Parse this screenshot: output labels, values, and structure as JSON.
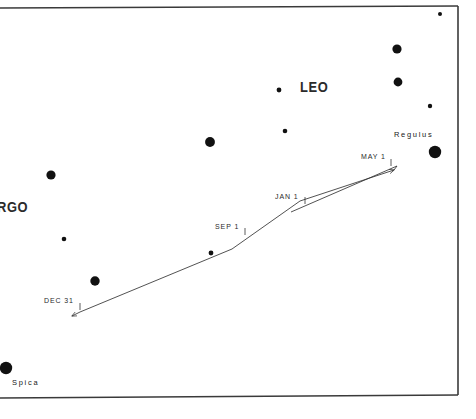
{
  "figure": {
    "kind": "star-chart",
    "background_color": "#ffffff",
    "ink_color": "#111111",
    "frame": {
      "stroke": "#3a3a3a",
      "top_left_x": 0,
      "top_left_y": 8,
      "top_right_x": 458,
      "top_right_y": 6,
      "bottom_right_x": 458,
      "bottom_right_y": 395,
      "bottom_left_x": 0,
      "bottom_left_y": 398
    }
  },
  "constellations": [
    {
      "id": "leo",
      "label": "LEO",
      "x": 300,
      "y": 86
    },
    {
      "id": "virgo",
      "label": "RGO",
      "x": 0,
      "y": 206,
      "note": "clipped-left-edge-of-VIRGO"
    }
  ],
  "named_stars": [
    {
      "id": "regulus",
      "label": "Regulus",
      "label_x": 394,
      "label_y": 134,
      "star_x": 435,
      "star_y": 152,
      "radius": 6.2
    },
    {
      "id": "spica",
      "label": "Spica",
      "label_x": 12,
      "label_y": 382,
      "star_x": 6,
      "star_y": 368,
      "radius": 6.2
    }
  ],
  "stars": [
    {
      "x": 440,
      "y": 14,
      "r": 2.0
    },
    {
      "x": 397,
      "y": 49,
      "r": 4.6
    },
    {
      "x": 398,
      "y": 82,
      "r": 4.4
    },
    {
      "x": 430,
      "y": 106,
      "r": 2.2
    },
    {
      "x": 279,
      "y": 90,
      "r": 2.4
    },
    {
      "x": 285,
      "y": 131,
      "r": 2.3
    },
    {
      "x": 210,
      "y": 142,
      "r": 4.9
    },
    {
      "x": 51,
      "y": 175,
      "r": 4.6
    },
    {
      "x": 64,
      "y": 239,
      "r": 2.3
    },
    {
      "x": 95,
      "y": 281,
      "r": 4.7
    },
    {
      "x": 211,
      "y": 253,
      "r": 2.4
    },
    {
      "x": 435,
      "y": 152,
      "r": 6.2
    },
    {
      "x": 6,
      "y": 368,
      "r": 6.2
    }
  ],
  "path": {
    "description": "planet track with retrograde loop",
    "stroke": "#333333",
    "stroke_width": 0.8,
    "main_track": "M 80,312 L 232,249 L 300,201 L 394,170",
    "retrograde_upper": "M 291,212 L 397,166",
    "arrow_head": {
      "x": 396,
      "y": 167
    },
    "arrow_tail": {
      "x": 80,
      "y": 313
    }
  },
  "date_markers": [
    {
      "id": "dec31",
      "label": "DEC 31",
      "label_x": 44,
      "label_y": 300,
      "tick_x": 80,
      "tick_y": 307
    },
    {
      "id": "sep1",
      "label": "SEP 1",
      "label_x": 215,
      "label_y": 226,
      "tick_x": 245,
      "tick_y": 232
    },
    {
      "id": "jan1",
      "label": "JAN 1",
      "label_x": 275,
      "label_y": 196,
      "tick_x": 305,
      "tick_y": 201
    },
    {
      "id": "may1",
      "label": "MAY 1",
      "label_x": 361,
      "label_y": 156,
      "tick_x": 391,
      "tick_y": 163
    }
  ]
}
